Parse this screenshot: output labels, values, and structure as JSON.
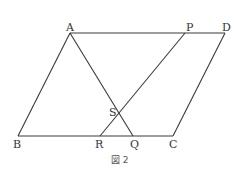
{
  "figure": {
    "caption": "図 2",
    "shape": "parallelogram ABCD with segments AQ and PR intersecting at S"
  },
  "points": {
    "A": {
      "label": "A",
      "x": 70,
      "y": 33
    },
    "P": {
      "label": "P",
      "x": 185,
      "y": 33
    },
    "D": {
      "label": "D",
      "x": 225,
      "y": 33
    },
    "B": {
      "label": "B",
      "x": 18,
      "y": 136
    },
    "R": {
      "label": "R",
      "x": 100,
      "y": 136
    },
    "Q": {
      "label": "Q",
      "x": 133,
      "y": 136
    },
    "C": {
      "label": "C",
      "x": 173,
      "y": 136
    },
    "S": {
      "label": "S",
      "x": 119,
      "y": 112
    }
  },
  "segments": [
    [
      "A",
      "D"
    ],
    [
      "B",
      "C"
    ],
    [
      "A",
      "B"
    ],
    [
      "D",
      "C"
    ],
    [
      "A",
      "Q"
    ],
    [
      "P",
      "R"
    ]
  ]
}
